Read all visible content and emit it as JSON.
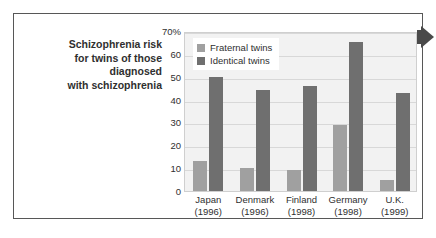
{
  "caption": {
    "lines": [
      "Schizophrenia risk",
      "for twins of those",
      "diagnosed",
      "with schizophrenia"
    ]
  },
  "colors": {
    "fraternal": "#a0a0a0",
    "identical": "#6f6f6f",
    "plot_background": "#f2f2f2",
    "gridline": "#d8d8d8",
    "text": "#2f2f2f",
    "panel_border": "#575757",
    "edge_arrow": "#4a4a4a"
  },
  "chart_data": {
    "type": "bar",
    "title": "Schizophrenia risk for twins of those diagnosed with schizophrenia",
    "xlabel": "",
    "ylabel": "",
    "ylim": [
      0,
      70
    ],
    "yticks": [
      0,
      10,
      20,
      30,
      40,
      50,
      60,
      70
    ],
    "ytick_labels": [
      "0",
      "10",
      "20",
      "30",
      "40",
      "50",
      "60",
      "70%"
    ],
    "grid": true,
    "legend_position": "top-left",
    "categories": [
      "Japan",
      "Denmark",
      "Finland",
      "Germany",
      "U.K."
    ],
    "category_years": [
      "(1996)",
      "(1996)",
      "(1998)",
      "(1998)",
      "(1999)"
    ],
    "series": [
      {
        "name": "Fraternal twins",
        "values": [
          13,
          10,
          9,
          29,
          5
        ]
      },
      {
        "name": "Identical twins",
        "values": [
          50,
          44,
          46,
          65,
          43
        ]
      }
    ]
  }
}
